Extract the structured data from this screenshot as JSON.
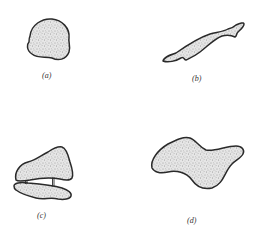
{
  "figure": {
    "panels": [
      {
        "id": "a",
        "label": "(a)",
        "description": "compact rounded blob"
      },
      {
        "id": "b",
        "label": "(b)",
        "description": "elongated thin diagonal blob"
      },
      {
        "id": "c",
        "label": "(c)",
        "description": "two blobs connected by two thin struts"
      },
      {
        "id": "d",
        "label": "(d)",
        "description": "large wavy irregular blob"
      }
    ],
    "colors": {
      "outline": "#2a2a2a",
      "stipple_dots": "#555555",
      "fill_base": "#e4e4e4",
      "background": "#ffffff"
    }
  }
}
